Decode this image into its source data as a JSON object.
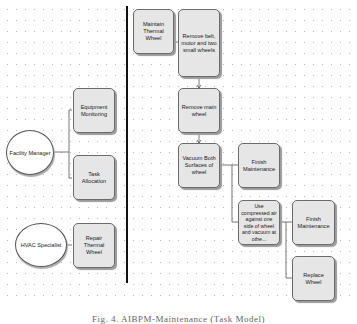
{
  "diagram": {
    "lanes": {
      "roles": [
        {
          "id": "facility-manager",
          "label": "Facility Manager"
        },
        {
          "id": "hvac-specialist",
          "label": "HVAC Specialist"
        }
      ],
      "role_tasks": [
        {
          "id": "equipment-monitoring",
          "label": "Equipment Monitoring",
          "role": "facility-manager"
        },
        {
          "id": "task-allocation",
          "label": "Task Allocation",
          "role": "facility-manager"
        },
        {
          "id": "repair-thermal-wheel",
          "label": "Repair Thermal Wheel",
          "role": "hvac-specialist"
        }
      ]
    },
    "process": {
      "nodes": [
        {
          "id": "maintain-thermal-wheel",
          "label": "Maintain Thermal Wheel"
        },
        {
          "id": "remove-belt",
          "label": "Remove belt, motor and two small wheels"
        },
        {
          "id": "remove-main-wheel",
          "label": "Remove main wheel"
        },
        {
          "id": "vacuum-both-surfaces",
          "label": "Vacuum Both Surfaces of wheel"
        },
        {
          "id": "finish-maintenance-1",
          "label": "Finish Maintenance"
        },
        {
          "id": "use-compressed-air",
          "label": "Use compressed air against one side of wheel and vacuum at othe..."
        },
        {
          "id": "finish-maintenance-2",
          "label": "Finish Maintenance"
        },
        {
          "id": "replace-wheel",
          "label": "Replace Wheel"
        }
      ],
      "edges": [
        [
          "facility-manager",
          "equipment-monitoring"
        ],
        [
          "facility-manager",
          "task-allocation"
        ],
        [
          "hvac-specialist",
          "repair-thermal-wheel"
        ],
        [
          "maintain-thermal-wheel",
          "remove-belt"
        ],
        [
          "remove-belt",
          "remove-main-wheel"
        ],
        [
          "remove-main-wheel",
          "vacuum-both-surfaces"
        ],
        [
          "vacuum-both-surfaces",
          "finish-maintenance-1"
        ],
        [
          "vacuum-both-surfaces",
          "use-compressed-air"
        ],
        [
          "use-compressed-air",
          "finish-maintenance-2"
        ],
        [
          "use-compressed-air",
          "replace-wheel"
        ]
      ]
    },
    "colors": {
      "node_fill": "#e6e6e6",
      "node_border": "#6b6b6b",
      "divider": "#111111",
      "grid_dots": "#b9b9b9"
    }
  },
  "caption": "Fig. 4. AIBPM-Maintenance (Task Model)"
}
